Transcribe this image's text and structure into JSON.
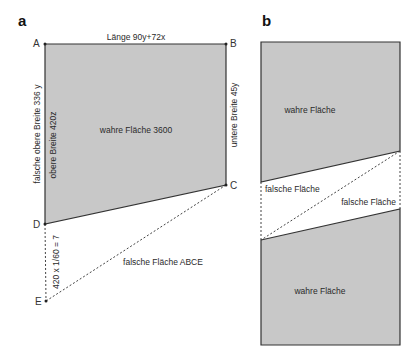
{
  "colors": {
    "fill_gray": "#c8c8c8",
    "stroke": "#333333",
    "background": "#ffffff"
  },
  "panel_a": {
    "label": "a",
    "points": {
      "A": "A",
      "B": "B",
      "C": "C",
      "D": "D",
      "E": "E"
    },
    "top_label": "Länge 90y+72x",
    "left_outer_label": "falsche obere Breite 336 y",
    "left_inner_label": "obere Breite 420z",
    "right_label": "untere Breite 45y",
    "center_label": "wahre Fläche 3600",
    "de_label": "420 x 1/60 = 7",
    "false_area_label": "falsche Fläche ABCE"
  },
  "panel_b": {
    "label": "b",
    "top_true_label": "wahre Fläche",
    "false_left_label": "falsche Fläche",
    "false_right_label": "falsche Fläche",
    "bottom_true_label": "wahre Fläche"
  }
}
